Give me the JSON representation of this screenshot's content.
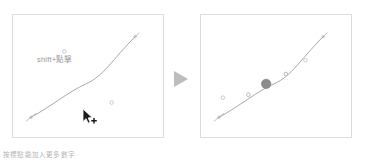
{
  "figure": {
    "hint_label": "shift+點擊",
    "caption": "按標點能加入更多數字",
    "arrow_icon": "triangle-right-icon",
    "cursor_icon": "pointer-add-icon",
    "colors": {
      "panel_border": "#dcdcdc",
      "curve_stroke": "#9e9e9e",
      "point_outline": "#b5b5b5",
      "point_selected_fill": "#8c8c8c",
      "arrow_fill": "#bdbdbd",
      "hint_text": "#9a9a9a",
      "caption_text": "#b4b4b4",
      "background": "#ffffff"
    },
    "panels": [
      {
        "name": "before",
        "label": "before",
        "curve_path": "M 18 104 C 40 92, 56 78, 74 70 C 92 62, 100 46, 124 22",
        "endpoints": [
          {
            "x": 18,
            "y": 104
          },
          {
            "x": 124,
            "y": 22
          }
        ],
        "loose_points": [
          {
            "x": 52,
            "y": 37
          },
          {
            "x": 100,
            "y": 89
          }
        ],
        "on_curve_points": []
      },
      {
        "name": "after",
        "label": "after",
        "curve_path": "M 18 104 C 40 92, 56 78, 74 70 C 92 62, 100 46, 124 22",
        "endpoints": [
          {
            "x": 18,
            "y": 104
          },
          {
            "x": 124,
            "y": 22
          }
        ],
        "loose_points": [
          {
            "x": 22,
            "y": 84
          },
          {
            "x": 106,
            "y": 46
          }
        ],
        "on_curve_points": [
          {
            "x": 48,
            "y": 81
          },
          {
            "x": 86,
            "y": 60
          }
        ],
        "selected_point": {
          "x": 66,
          "y": 70,
          "r": 5
        }
      }
    ]
  }
}
